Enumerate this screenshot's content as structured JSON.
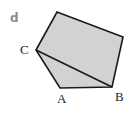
{
  "figure": {
    "part_label": "d",
    "shape_name": "pentagon-with-diagonal",
    "fill_color": "#d2d2d2",
    "stroke_color": "#1a1a1a",
    "background_color": "#ffffff",
    "label_color": "#262626",
    "part_label_color": "#8c8c8c",
    "stroke_width": 1.6,
    "vertices": [
      {
        "name": "C",
        "x": 36,
        "y": 50
      },
      {
        "name": "T",
        "x": 57,
        "y": 12
      },
      {
        "name": "R",
        "x": 123,
        "y": 37
      },
      {
        "name": "B",
        "x": 112,
        "y": 87
      },
      {
        "name": "A",
        "x": 60,
        "y": 88
      }
    ],
    "outline_points": "36,50 57,12 123,37 112,87 60,88",
    "diagonal": {
      "from": "C",
      "to": "B",
      "x1": 36,
      "y1": 50,
      "x2": 112,
      "y2": 87
    },
    "labels": [
      {
        "id": "A",
        "text": "A"
      },
      {
        "id": "B",
        "text": "B"
      },
      {
        "id": "C",
        "text": "C"
      }
    ]
  }
}
